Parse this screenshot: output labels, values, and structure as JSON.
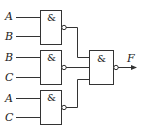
{
  "diagram": {
    "type": "logic-circuit",
    "gates": [
      {
        "id": "g1",
        "symbol": "&",
        "kind": "NAND",
        "inputs": [
          "A",
          "B"
        ]
      },
      {
        "id": "g2",
        "symbol": "&",
        "kind": "NAND",
        "inputs": [
          "B",
          "C"
        ]
      },
      {
        "id": "g3",
        "symbol": "&",
        "kind": "NAND",
        "inputs": [
          "A",
          "C"
        ]
      },
      {
        "id": "g4",
        "symbol": "&",
        "kind": "NAND",
        "inputs": [
          "g1",
          "g2",
          "g3"
        ]
      }
    ],
    "input_labels": [
      "A",
      "B",
      "B",
      "C",
      "A",
      "C"
    ],
    "output_label": "F"
  }
}
